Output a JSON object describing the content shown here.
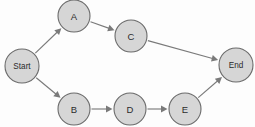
{
  "diagram": {
    "type": "node-link-flow-diagram",
    "background_color": "#fdfdfd",
    "node_fill_color": "#d6d6d6",
    "node_stroke_color": "#6b6b6b",
    "edge_color": "#7a7a7a",
    "label_color": "#2b2b2b",
    "nodes": [
      {
        "id": "start",
        "label": "Start",
        "cx": 22,
        "cy": 66,
        "r": 17,
        "label_size": "small"
      },
      {
        "id": "a",
        "label": "A",
        "cx": 74,
        "cy": 16,
        "r": 16,
        "label_size": "normal"
      },
      {
        "id": "c",
        "label": "C",
        "cx": 131,
        "cy": 36,
        "r": 16,
        "label_size": "normal"
      },
      {
        "id": "end",
        "label": "End",
        "cx": 236,
        "cy": 65,
        "r": 17,
        "label_size": "small"
      },
      {
        "id": "b",
        "label": "B",
        "cx": 74,
        "cy": 109,
        "r": 16,
        "label_size": "normal"
      },
      {
        "id": "d",
        "label": "D",
        "cx": 130,
        "cy": 109,
        "r": 16,
        "label_size": "normal"
      },
      {
        "id": "e",
        "label": "E",
        "cx": 185,
        "cy": 109,
        "r": 16,
        "label_size": "normal"
      }
    ],
    "edges": [
      {
        "id": "start-a",
        "from": "start",
        "to": "a",
        "label": ""
      },
      {
        "id": "start-b",
        "from": "start",
        "to": "b",
        "label": ""
      },
      {
        "id": "a-c",
        "from": "a",
        "to": "c",
        "label": ""
      },
      {
        "id": "c-end",
        "from": "c",
        "to": "end",
        "label": ""
      },
      {
        "id": "b-d",
        "from": "b",
        "to": "d",
        "label": ""
      },
      {
        "id": "d-e",
        "from": "d",
        "to": "e",
        "label": ""
      },
      {
        "id": "e-end",
        "from": "e",
        "to": "end",
        "label": ""
      }
    ]
  }
}
